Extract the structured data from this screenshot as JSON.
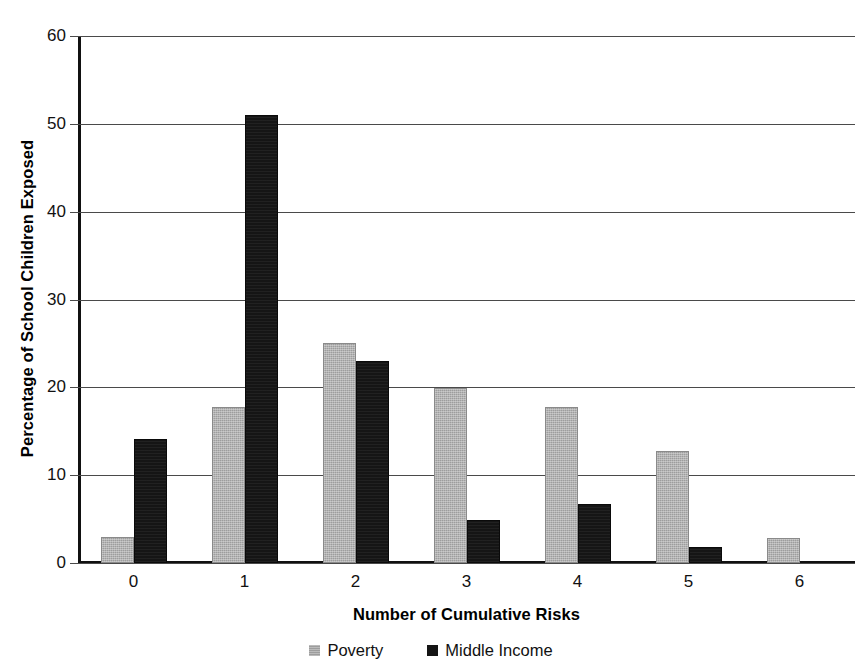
{
  "chart_data": {
    "type": "bar",
    "title": "",
    "title_truncated": true,
    "xlabel": "Number of Cumulative Risks",
    "ylabel": "Percentage of School Children Exposed",
    "categories": [
      "0",
      "1",
      "2",
      "3",
      "4",
      "5",
      "6"
    ],
    "series": [
      {
        "name": "Poverty",
        "color": "#9d9d9d",
        "values": [
          3,
          17.8,
          25,
          19.9,
          17.8,
          12.7,
          2.8
        ]
      },
      {
        "name": "Middle Income",
        "color": "#151515",
        "values": [
          14.1,
          51,
          23,
          4.9,
          6.7,
          1.8,
          0
        ]
      }
    ],
    "ylim": [
      0,
      60
    ],
    "ytick_values": [
      60,
      50,
      40,
      30,
      20,
      10,
      0
    ],
    "ytick_labels": [
      "60",
      "50",
      "40",
      "30",
      "20",
      "10",
      "0"
    ],
    "ystep": 10,
    "grid": true,
    "grid_axis": "y",
    "legend_position": "bottom",
    "bar_group_gap": true,
    "plot_background": "#ffffff"
  },
  "legend": {
    "items": [
      {
        "label": "Poverty",
        "swatch": "poverty-swatch"
      },
      {
        "label": "Middle Income",
        "swatch": "middle-income-swatch"
      }
    ]
  }
}
